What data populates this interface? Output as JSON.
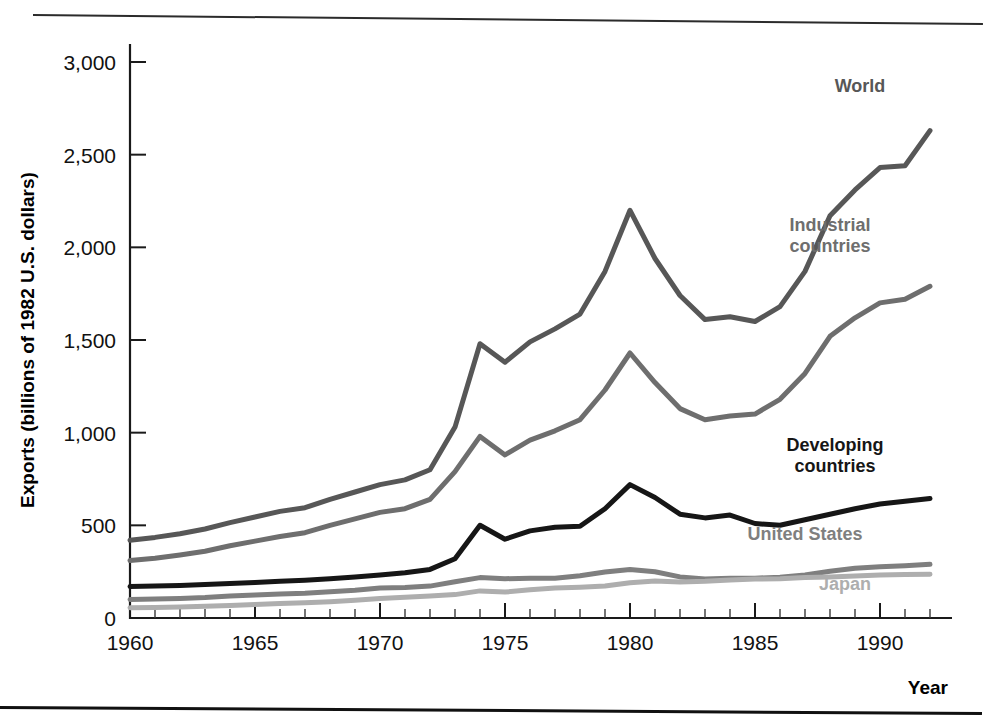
{
  "figure": {
    "title_partial": "",
    "year_axis_title": "Year"
  },
  "chart_data": {
    "type": "line",
    "title": "",
    "xlabel": "Year",
    "ylabel": "Exports (billions of 1982 U.S. dollars)",
    "xlim": [
      1960,
      1992
    ],
    "ylim": [
      0,
      3000
    ],
    "grid": false,
    "legend": "inline-series-labels",
    "ytick_labels": [
      "0",
      "500",
      "1,000",
      "1,500",
      "2,000",
      "2,500",
      "3,000"
    ],
    "ytick_values": [
      0,
      500,
      1000,
      1500,
      2000,
      2500,
      3000
    ],
    "xtick_labels": [
      "1960",
      "1965",
      "1970",
      "1975",
      "1980",
      "1985",
      "1990"
    ],
    "xtick_values": [
      1960,
      1965,
      1970,
      1975,
      1980,
      1985,
      1990
    ],
    "x": [
      1960,
      1961,
      1962,
      1963,
      1964,
      1965,
      1966,
      1967,
      1968,
      1969,
      1970,
      1971,
      1972,
      1973,
      1974,
      1975,
      1976,
      1977,
      1978,
      1979,
      1980,
      1981,
      1982,
      1983,
      1984,
      1985,
      1986,
      1987,
      1988,
      1989,
      1990,
      1991,
      1992
    ],
    "series": [
      {
        "name": "World",
        "color": "#575757",
        "width": 5,
        "label_x": 1989.2,
        "label_y": 2840,
        "label_anchor": "middle",
        "values": [
          420,
          435,
          455,
          480,
          515,
          545,
          575,
          595,
          640,
          680,
          720,
          745,
          800,
          1030,
          1480,
          1380,
          1490,
          1560,
          1640,
          1870,
          2200,
          1940,
          1740,
          1610,
          1625,
          1600,
          1680,
          1870,
          2170,
          2310,
          2430,
          2440,
          2630
        ]
      },
      {
        "name": "Industrial\ncountries",
        "color": "#6e6e6e",
        "width": 5,
        "label_x": 1988.0,
        "label_y": 2090,
        "label_anchor": "middle",
        "values": [
          310,
          322,
          340,
          360,
          390,
          415,
          440,
          460,
          500,
          535,
          570,
          590,
          640,
          790,
          980,
          880,
          960,
          1010,
          1070,
          1230,
          1430,
          1270,
          1130,
          1070,
          1090,
          1100,
          1180,
          1320,
          1520,
          1620,
          1700,
          1720,
          1790
        ]
      },
      {
        "name": "Developing\ncountries",
        "color": "#161616",
        "width": 5,
        "label_x": 1988.2,
        "label_y": 900,
        "label_anchor": "middle",
        "values": [
          170,
          172,
          176,
          180,
          186,
          192,
          198,
          204,
          212,
          222,
          232,
          244,
          262,
          320,
          500,
          425,
          470,
          490,
          495,
          590,
          720,
          650,
          560,
          540,
          555,
          510,
          500,
          530,
          560,
          590,
          615,
          630,
          645
        ]
      },
      {
        "name": "United States",
        "color": "#7f7f7f",
        "width": 5,
        "label_x": 1987.0,
        "label_y": 420,
        "label_anchor": "middle",
        "values": [
          100,
          102,
          106,
          110,
          118,
          124,
          130,
          134,
          142,
          150,
          162,
          164,
          172,
          196,
          218,
          212,
          215,
          215,
          228,
          248,
          262,
          250,
          222,
          210,
          215,
          215,
          220,
          232,
          252,
          268,
          276,
          282,
          290
        ]
      },
      {
        "name": "Japan",
        "color": "#aeaeae",
        "width": 5,
        "label_x": 1988.6,
        "label_y": 150,
        "label_anchor": "middle",
        "values": [
          55,
          57,
          60,
          63,
          68,
          73,
          78,
          82,
          88,
          96,
          106,
          112,
          118,
          126,
          146,
          140,
          152,
          162,
          166,
          172,
          190,
          200,
          195,
          198,
          205,
          210,
          212,
          218,
          222,
          226,
          232,
          234,
          236
        ]
      }
    ]
  }
}
